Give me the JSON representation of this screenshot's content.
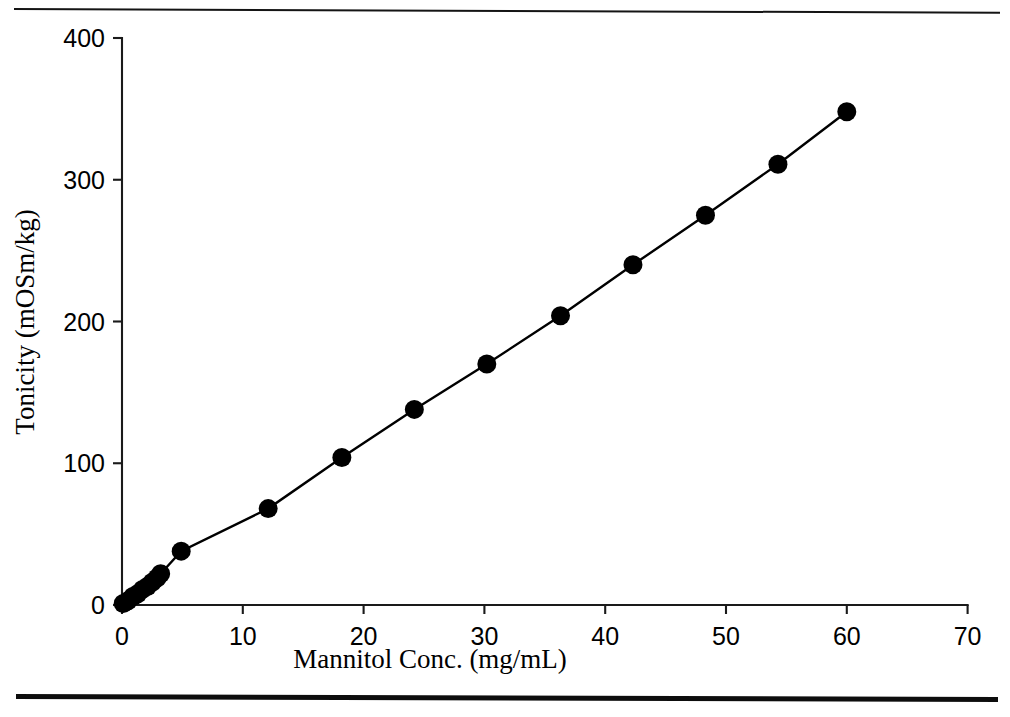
{
  "figure": {
    "top_rule": "horizontal-rule-thin",
    "bottom_rule": "horizontal-rule-thick"
  },
  "chart_data": {
    "type": "scatter",
    "title": "",
    "subtitle": "",
    "xlabel": "Mannitol Conc. (mg/mL)",
    "ylabel": "Tonicity (mOSm/kg)",
    "xlim": [
      0,
      70
    ],
    "ylim": [
      0,
      400
    ],
    "xticks": [
      0,
      10,
      20,
      30,
      40,
      50,
      60,
      70
    ],
    "yticks": [
      0,
      100,
      200,
      300,
      400
    ],
    "xtick_labels": [
      "0",
      "10",
      "20",
      "30",
      "40",
      "50",
      "60",
      "70"
    ],
    "ytick_labels": [
      "0",
      "100",
      "200",
      "300",
      "400"
    ],
    "grid": false,
    "legend": null,
    "legend_position": "none",
    "marker": "filled-circle",
    "marker_color": "#000000",
    "line_color": "#000000",
    "connected": true,
    "series": [
      {
        "name": "Mannitol calibration",
        "x": [
          0.1,
          0.5,
          0.9,
          1.3,
          1.7,
          2.1,
          2.5,
          2.9,
          3.2,
          4.9,
          12.1,
          18.2,
          24.2,
          30.2,
          36.3,
          42.3,
          48.3,
          54.3,
          60.0
        ],
        "y": [
          1,
          3,
          6,
          8,
          11,
          13,
          16,
          19,
          22,
          38,
          68,
          104,
          138,
          170,
          204,
          240,
          275,
          311,
          348
        ]
      }
    ],
    "annotations": []
  }
}
